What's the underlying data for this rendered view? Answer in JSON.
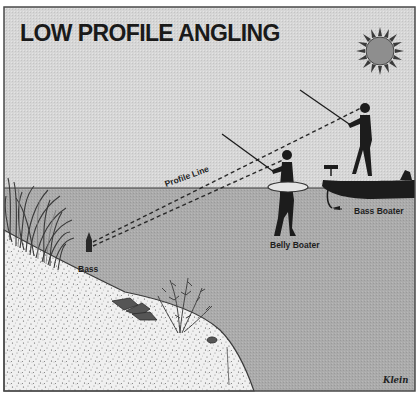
{
  "diagram": {
    "title": "LOW PROFILE ANGLING",
    "labels": {
      "profile_line": "Profile Line",
      "bass": "Bass",
      "belly_boater": "Belly Boater",
      "bass_boater": "Bass Boater"
    },
    "signature": "Klein",
    "elements": [
      "sun",
      "bass-boat",
      "standing-angler",
      "trolling-motor",
      "belly-boat-angler",
      "float-tube",
      "bass-fish",
      "reeds",
      "shoreline-bank",
      "rocks",
      "underwater-weeds",
      "profile-lines"
    ],
    "colors": {
      "sky": "#d4d4d4",
      "water": "#a9a9a9",
      "sand": "#efefef",
      "silhouette": "#1c1c1c",
      "frame": "#4a4a4a"
    }
  }
}
